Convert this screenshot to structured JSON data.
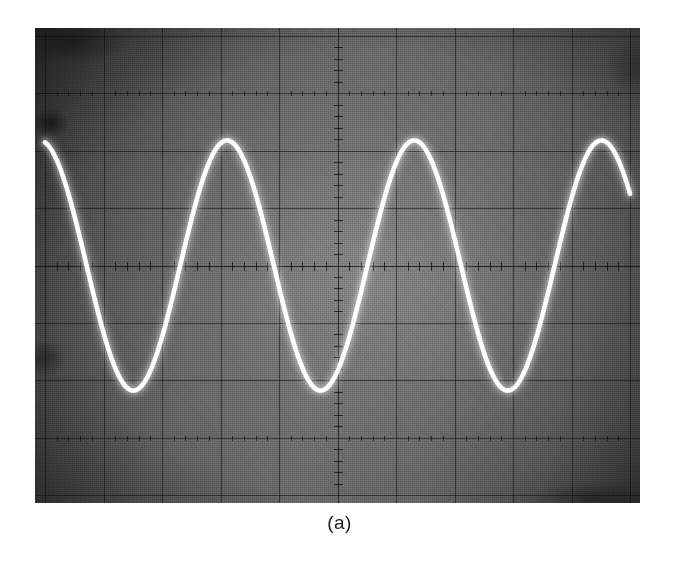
{
  "figure": {
    "caption": "(a)",
    "kind": "oscilloscope-photograph"
  },
  "display": {
    "screen_color": "#666666",
    "trace_color": "#ffffff",
    "graticule_color": "#0c0c0c",
    "divisions_horizontal": 10,
    "divisions_vertical": 8,
    "subdivisions_per_division": 5
  },
  "chart_data": {
    "type": "line",
    "title": "(a)",
    "xlabel": "",
    "ylabel": "",
    "waveform": "sine",
    "grid": true,
    "legend": "none",
    "x_divisions": 10,
    "y_divisions": 8,
    "xlim_div": [
      0,
      10
    ],
    "ylim_div": [
      -4,
      4
    ],
    "amplitude_div": 2.18,
    "period_div": 3.2,
    "cycles_visible": 3.2,
    "phase_deg": 100,
    "offset_div": 0,
    "peaks_div": [
      3.02,
      6.22,
      9.42
    ],
    "troughs_div": [
      1.42,
      4.62,
      7.82
    ],
    "x": [
      0.0,
      0.2,
      0.4,
      0.6,
      0.8,
      1.0,
      1.2,
      1.4,
      1.6,
      1.8,
      2.0,
      2.2,
      2.4,
      2.6,
      2.8,
      3.0,
      3.2,
      3.4,
      3.6,
      3.8,
      4.0,
      4.2,
      4.4,
      4.6,
      4.8,
      5.0,
      5.2,
      5.4,
      5.6,
      5.8,
      6.0,
      6.2,
      6.4,
      6.6,
      6.8,
      7.0,
      7.2,
      7.4,
      7.6,
      7.8,
      8.0,
      8.2,
      8.4,
      8.6,
      8.8,
      9.0,
      9.2,
      9.4,
      9.6,
      9.8,
      10.0
    ],
    "y": [
      1.77,
      1.02,
      0.13,
      -0.79,
      -1.55,
      -2.03,
      -2.17,
      -1.96,
      -1.42,
      -0.62,
      0.31,
      1.18,
      1.82,
      2.15,
      2.11,
      1.71,
      1.02,
      0.13,
      -0.79,
      -1.55,
      -2.03,
      -2.17,
      -1.96,
      -1.42,
      -0.62,
      0.31,
      1.18,
      1.82,
      2.15,
      2.11,
      1.71,
      1.02,
      0.13,
      -0.79,
      -1.55,
      -2.03,
      -2.17,
      -1.96,
      -1.42,
      -0.62,
      0.31,
      1.18,
      1.82,
      2.15,
      2.11,
      1.71,
      1.02,
      0.13,
      -0.79,
      -1.55,
      -2.03
    ]
  }
}
